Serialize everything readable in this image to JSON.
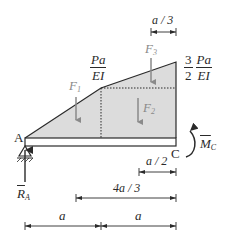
{
  "diagram": {
    "points": {
      "A": "A",
      "C": "C"
    },
    "moment_diagram": {
      "left_value": {
        "num": "Pa",
        "den": "EI"
      },
      "right_value": {
        "coef": "3",
        "coef_den": "2",
        "num": "Pa",
        "den": "EI"
      },
      "fill_color": "#dcdcdc",
      "outline_color": "#2a2a2a"
    },
    "forces": {
      "F1": {
        "label": "F",
        "sub": "1"
      },
      "F2": {
        "label": "F",
        "sub": "2"
      },
      "F3": {
        "label": "F",
        "sub": "3"
      },
      "color": "#8a8a8a"
    },
    "reaction": {
      "label": "R",
      "sub": "A"
    },
    "moment": {
      "label": "M",
      "sub": "C"
    },
    "dimensions": {
      "top": "a / 3",
      "d1": "a / 2",
      "d2": "4a / 3",
      "bottom_left": "a",
      "bottom_right": "a"
    }
  }
}
